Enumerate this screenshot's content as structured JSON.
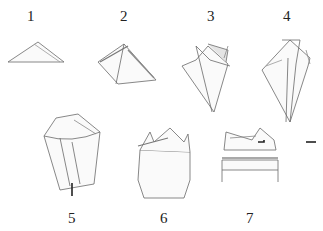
{
  "diagram": {
    "type": "step-by-step folding instructions",
    "steps": [
      {
        "number": "1",
        "description": "flat triangle"
      },
      {
        "number": "2",
        "description": "corners folded up to apex"
      },
      {
        "number": "3",
        "description": "side points folded in, forming a cone"
      },
      {
        "number": "4",
        "description": "sides folded behind",
        "arrows": [
          "left",
          "right"
        ]
      },
      {
        "number": "5",
        "description": "cone shaped with petals on top",
        "arrows": [
          "up"
        ]
      },
      {
        "number": "6",
        "description": "turned over, points showing at top"
      },
      {
        "number": "7",
        "description": "band folded across the base"
      }
    ],
    "colors": {
      "line": "#6a6a6a",
      "shade": "#c8c8c8",
      "arrow": "#222222",
      "label": "#222222",
      "background": "#ffffff"
    }
  }
}
